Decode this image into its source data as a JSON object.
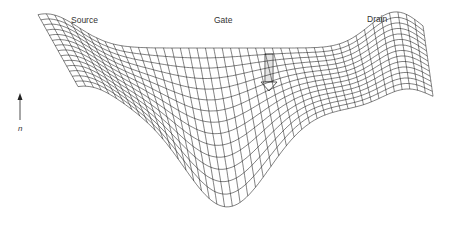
{
  "labels": {
    "source": "Source",
    "gate": "Gate",
    "drain": "Drain",
    "axis": "n"
  },
  "colors": {
    "line": "#1a1a1a",
    "background": "#ffffff"
  }
}
